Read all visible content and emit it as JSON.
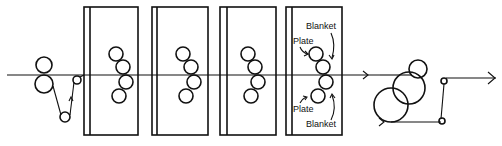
{
  "diagram": {
    "type": "web offset press schematic",
    "web_path_direction": "left-to-right",
    "stroke_color": "#111111",
    "background": "#ffffff",
    "infeed": {
      "rollers": [
        {
          "cx": 44,
          "cy": 65,
          "r": 8
        },
        {
          "cx": 44,
          "cy": 84,
          "r": 9
        }
      ],
      "dancer_rollers": [
        {
          "cx": 65,
          "cy": 117,
          "r": 5
        },
        {
          "cx": 77,
          "cy": 80,
          "r": 4
        }
      ]
    },
    "units": [
      {
        "id": "unit-1",
        "x": 84,
        "inner_x": 90,
        "w": 54
      },
      {
        "id": "unit-2",
        "x": 152,
        "inner_x": 157,
        "w": 56
      },
      {
        "id": "unit-3",
        "x": 220,
        "inner_x": 227,
        "w": 56
      },
      {
        "id": "unit-4",
        "x": 286,
        "inner_x": 292,
        "w": 56
      }
    ],
    "labels": {
      "top_blanket": "Blanket",
      "top_plate": "Plate",
      "bottom_plate": "Plate",
      "bottom_blanket": "Blanket"
    },
    "dryer_chill": {
      "rollers": [
        {
          "cx": 391,
          "cy": 105,
          "r": 17
        },
        {
          "cx": 409,
          "cy": 88,
          "r": 16
        },
        {
          "cx": 418,
          "cy": 69,
          "r": 9
        }
      ],
      "guide_rollers": [
        {
          "cx": 444,
          "cy": 81,
          "r": 3
        },
        {
          "cx": 442,
          "cy": 121,
          "r": 3
        }
      ]
    }
  }
}
